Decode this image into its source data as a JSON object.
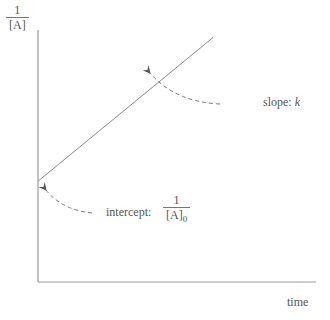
{
  "chart_data": {
    "type": "line",
    "title": "",
    "xlabel": "time",
    "ylabel": {
      "numerator": "1",
      "denominator": "[A]"
    },
    "series": [
      {
        "name": "1/[A] vs time",
        "x": [
          0,
          1
        ],
        "y": [
          0.4,
          0.97
        ]
      }
    ],
    "xlim": [
      0,
      1.1
    ],
    "ylim": [
      0,
      1.0
    ],
    "grid": false,
    "annotations": [
      {
        "label": "slope:",
        "label_italic": "k",
        "target": "line"
      },
      {
        "label": "intercept:",
        "fraction": {
          "numerator": "1",
          "denominator": "[A]",
          "subscript": "0"
        },
        "target": "y-intercept"
      }
    ]
  },
  "colors": {
    "axis": "#9a9a9a",
    "line": "#8a8a8a",
    "arrow": "#666666",
    "text": "#555555"
  }
}
